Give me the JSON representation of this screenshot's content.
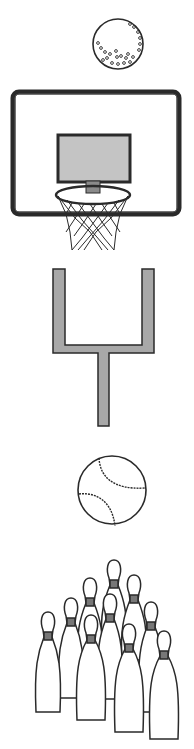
{
  "image": {
    "description": "Vertical strip of black-and-white sports clip art",
    "items": [
      {
        "name": "golf ball"
      },
      {
        "name": "basketball hoop"
      },
      {
        "name": "football goalpost"
      },
      {
        "name": "baseball"
      },
      {
        "name": "bowling pins",
        "count": 10
      }
    ]
  },
  "colors": {
    "background": "#ffffff",
    "outline": "#2a2a2a",
    "fill_gray": "#a8a8a8",
    "light_gray": "#bdbdbd"
  }
}
